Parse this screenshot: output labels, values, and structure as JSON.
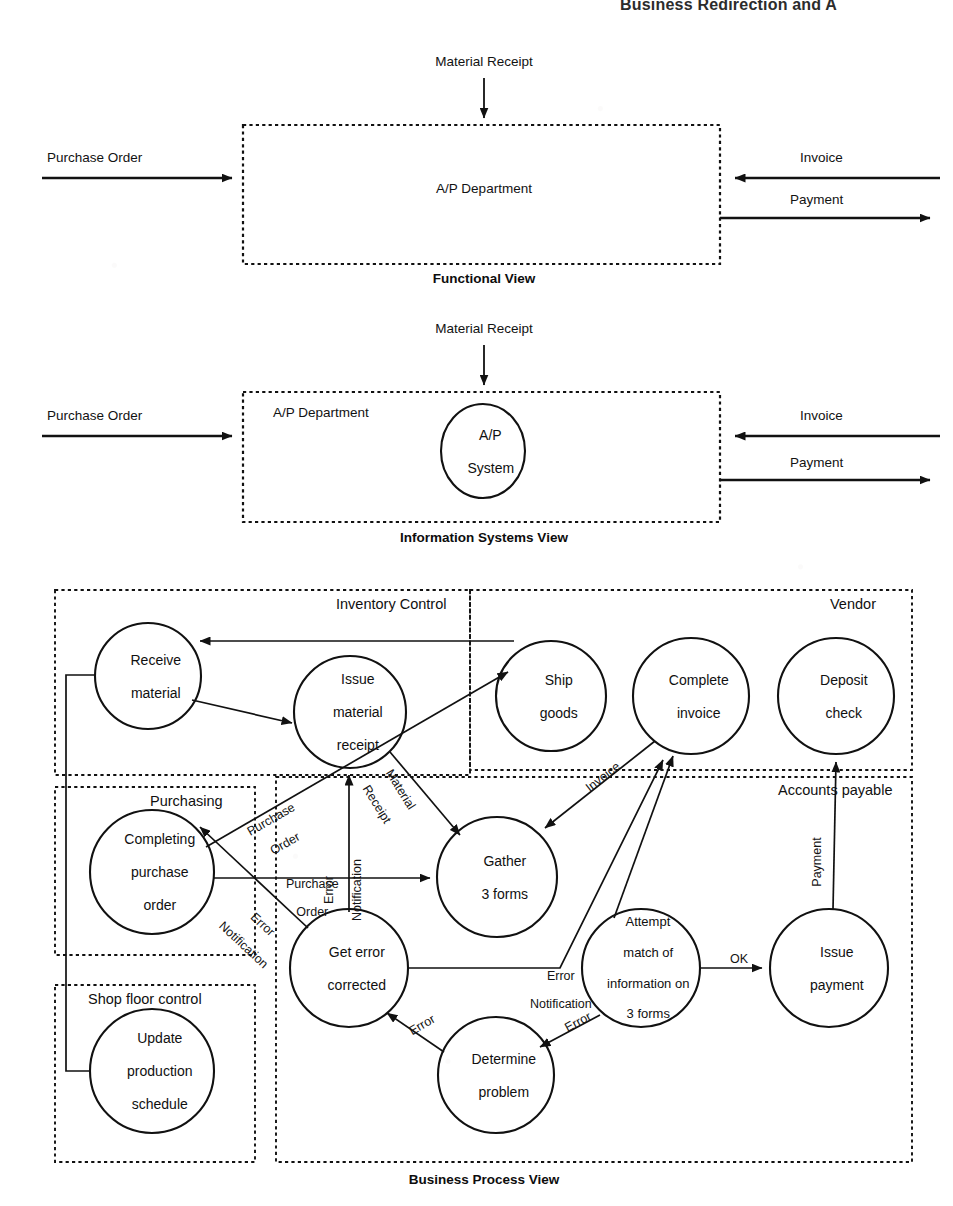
{
  "page": {
    "header_text": "Business Redirection and A",
    "background": "#ffffff",
    "ink": "#111111"
  },
  "views": [
    {
      "id": "functional",
      "caption": "Functional View"
    },
    {
      "id": "information_systems",
      "caption": "Information Systems View"
    },
    {
      "id": "business_process",
      "caption": "Business Process View"
    }
  ],
  "functional_view": {
    "caption": "Functional View",
    "box_label": "A/P Department",
    "inputs": [
      {
        "name": "purchase-order",
        "label": "Purchase Order",
        "side": "left"
      },
      {
        "name": "material-receipt",
        "label": "Material Receipt",
        "side": "top"
      },
      {
        "name": "invoice",
        "label": "Invoice",
        "side": "right"
      }
    ],
    "outputs": [
      {
        "name": "payment",
        "label": "Payment",
        "side": "right"
      }
    ]
  },
  "is_view": {
    "caption": "Information Systems View",
    "box_label": "A/P Department",
    "system_label": "A/P\nSystem",
    "system_label_lines": [
      "A/P",
      "System"
    ],
    "inputs": [
      {
        "name": "purchase-order",
        "label": "Purchase Order",
        "side": "left"
      },
      {
        "name": "material-receipt",
        "label": "Material Receipt",
        "side": "top"
      },
      {
        "name": "invoice",
        "label": "Invoice",
        "side": "right"
      }
    ],
    "outputs": [
      {
        "name": "payment",
        "label": "Payment",
        "side": "right"
      }
    ]
  },
  "process_view": {
    "caption": "Business Process View",
    "swimlanes": [
      {
        "id": "inventory-control",
        "label": "Inventory Control"
      },
      {
        "id": "vendor",
        "label": "Vendor"
      },
      {
        "id": "purchasing",
        "label": "Purchasing"
      },
      {
        "id": "accounts-payable",
        "label": "Accounts payable"
      },
      {
        "id": "shop-floor-control",
        "label": "Shop floor control"
      }
    ],
    "nodes": [
      {
        "id": "receive-material",
        "lane": "inventory-control",
        "lines": [
          "Receive",
          "material"
        ]
      },
      {
        "id": "issue-material-receipt",
        "lane": "inventory-control",
        "lines": [
          "Issue",
          "material",
          "receipt"
        ]
      },
      {
        "id": "ship-goods",
        "lane": "vendor",
        "lines": [
          "Ship",
          "goods"
        ]
      },
      {
        "id": "complete-invoice",
        "lane": "vendor",
        "lines": [
          "Complete",
          "invoice"
        ]
      },
      {
        "id": "deposit-check",
        "lane": "vendor",
        "lines": [
          "Deposit",
          "check"
        ]
      },
      {
        "id": "completing-purchase-order",
        "lane": "purchasing",
        "lines": [
          "Completing",
          "purchase",
          "order"
        ]
      },
      {
        "id": "gather-3-forms",
        "lane": "accounts-payable",
        "lines": [
          "Gather",
          "3 forms"
        ]
      },
      {
        "id": "get-error-corrected",
        "lane": "accounts-payable",
        "lines": [
          "Get error",
          "corrected"
        ]
      },
      {
        "id": "attempt-match",
        "lane": "accounts-payable",
        "lines": [
          "Attempt",
          "match of",
          "information on",
          "3 forms"
        ]
      },
      {
        "id": "issue-payment",
        "lane": "accounts-payable",
        "lines": [
          "Issue",
          "payment"
        ]
      },
      {
        "id": "determine-problem",
        "lane": "accounts-payable",
        "lines": [
          "Determine",
          "problem"
        ]
      },
      {
        "id": "update-production-schedule",
        "lane": "shop-floor-control",
        "lines": [
          "Update",
          "production",
          "schedule"
        ]
      }
    ],
    "edges": [
      {
        "id": "ship-to-receive",
        "from": "ship-goods",
        "to": "receive-material",
        "label": ""
      },
      {
        "id": "receive-to-issue",
        "from": "receive-material",
        "to": "issue-material-receipt",
        "label": ""
      },
      {
        "id": "receive-to-update",
        "from": "receive-material",
        "to": "update-production-schedule",
        "label": ""
      },
      {
        "id": "issue-to-gather",
        "from": "issue-material-receipt",
        "to": "gather-3-forms",
        "label": "Material\nReceipt",
        "label_lines": [
          "Material",
          "Receipt"
        ]
      },
      {
        "id": "cpo-to-ship",
        "from": "completing-purchase-order",
        "to": "ship-goods",
        "label": "Purchase\nOrder",
        "label_lines": [
          "Purchase",
          "Order"
        ]
      },
      {
        "id": "cpo-to-gather",
        "from": "completing-purchase-order",
        "to": "gather-3-forms",
        "label": "Purchase\nOrder",
        "label_lines": [
          "Purchase",
          "Order"
        ]
      },
      {
        "id": "getcorrected-to-issue",
        "from": "get-error-corrected",
        "to": "issue-material-receipt",
        "label": "Error\nNotification",
        "label_lines": [
          "Error",
          "Notification"
        ]
      },
      {
        "id": "getcorrected-to-cpo",
        "from": "get-error-corrected",
        "to": "completing-purchase-order",
        "label": "Error\nNotification",
        "label_lines": [
          "Error",
          "Notification"
        ]
      },
      {
        "id": "complete-invoice-to-gather",
        "from": "complete-invoice",
        "to": "gather-3-forms",
        "label": "Invoice"
      },
      {
        "id": "gather-to-attempt",
        "from": "gather-3-forms",
        "to": "attempt-match",
        "label": ""
      },
      {
        "id": "attempt-to-issue-payment",
        "from": "attempt-match",
        "to": "issue-payment",
        "label": "OK"
      },
      {
        "id": "attempt-to-determine",
        "from": "attempt-match",
        "to": "determine-problem",
        "label": "Error"
      },
      {
        "id": "determine-to-getcorrected",
        "from": "determine-problem",
        "to": "get-error-corrected",
        "label": "Error"
      },
      {
        "id": "getcorrected-to-complete-invoice",
        "from": "get-error-corrected",
        "to": "complete-invoice",
        "label": "Error\nNotification",
        "label_lines": [
          "Error",
          "Notification"
        ]
      },
      {
        "id": "issue-payment-to-deposit",
        "from": "issue-payment",
        "to": "deposit-check",
        "label": "Payment"
      }
    ]
  }
}
